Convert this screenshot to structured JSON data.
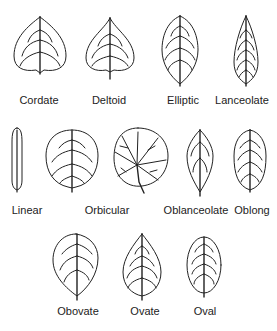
{
  "figure": {
    "stroke_color": "#222222",
    "background": "#ffffff"
  },
  "rows": [
    {
      "leaves": [
        {
          "id": "cordate",
          "label": "Cordate"
        },
        {
          "id": "deltoid",
          "label": "Deltoid"
        },
        {
          "id": "elliptic",
          "label": "Elliptic"
        },
        {
          "id": "lanceolate",
          "label": "Lanceolate"
        }
      ]
    },
    {
      "leaves": [
        {
          "id": "linear",
          "label": "Linear"
        },
        {
          "id": "orbicular",
          "label": "Orbicular"
        },
        {
          "id": "oblanceolate",
          "label": "Oblanceolate"
        },
        {
          "id": "oblong",
          "label": "Oblong"
        }
      ]
    },
    {
      "leaves": [
        {
          "id": "obovate",
          "label": "Obovate"
        },
        {
          "id": "ovate",
          "label": "Ovate"
        },
        {
          "id": "oval",
          "label": "Oval"
        }
      ]
    }
  ]
}
